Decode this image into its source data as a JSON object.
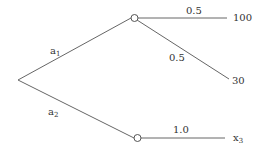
{
  "diagram": {
    "type": "decision-tree",
    "branches": [
      {
        "label": "a",
        "subscript": "1"
      },
      {
        "label": "a",
        "subscript": "2"
      }
    ],
    "outcomes": {
      "upper": [
        {
          "probability": "0.5",
          "payoff": "100"
        },
        {
          "probability": "0.5",
          "payoff": "30"
        }
      ],
      "lower": [
        {
          "probability": "1.0",
          "payoff": "x",
          "payoff_subscript": "3"
        }
      ]
    },
    "colors": {
      "line": "#555555",
      "text": "#333333",
      "node_fill": "#ffffff"
    }
  }
}
